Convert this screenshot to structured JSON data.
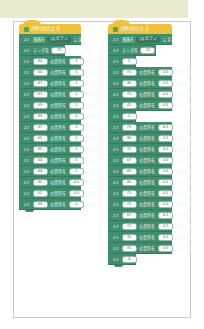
{
  "canvas": {
    "background_color": "#ffffff",
    "band_color": "#eaeace",
    "border_color": "#c8c8cc"
  },
  "palette": {
    "event_block": "#f0c23c",
    "music_block": "#3f8f6f",
    "music_block_dark": "#35795d",
    "oval_field": "#ffffff",
    "flag_green": "#55a84f"
  },
  "icons": {
    "green_flag": "green-flag-icon",
    "music_note": "♪♪"
  },
  "scripts": [
    {
      "id": "left",
      "hat": {
        "icon": "green-flag-icon",
        "label": "が押されたとき"
      },
      "blocks": [
        {
          "kind": "inst",
          "pre": "楽器を",
          "value": "(1) ピアノ",
          "post": "にする",
          "field": "drop"
        },
        {
          "kind": "tempo",
          "pre": "テンポを",
          "value": "72",
          "post": "にする",
          "field": "oval"
        },
        {
          "kind": "note",
          "pre": "",
          "value": "60",
          "mid": "の音符を",
          "beats": "1",
          "post": "拍鳴らす"
        },
        {
          "kind": "note",
          "pre": "",
          "value": "60",
          "mid": "の音符を",
          "beats": "1",
          "post": "拍鳴らす"
        },
        {
          "kind": "note",
          "pre": "",
          "value": "67",
          "mid": "の音符を",
          "beats": "1",
          "post": "拍鳴らす"
        },
        {
          "kind": "note",
          "pre": "",
          "value": "67",
          "mid": "の音符を",
          "beats": "1",
          "post": "拍鳴らす"
        },
        {
          "kind": "note",
          "pre": "",
          "value": "69",
          "mid": "の音符を",
          "beats": "1",
          "post": "拍鳴らす"
        },
        {
          "kind": "note",
          "pre": "",
          "value": "69",
          "mid": "の音符を",
          "beats": "2",
          "post": "拍鳴らす"
        },
        {
          "kind": "note",
          "pre": "",
          "value": "67",
          "mid": "の音符を",
          "beats": "2",
          "post": "拍鳴らす"
        },
        {
          "kind": "note",
          "pre": "",
          "value": "65",
          "mid": "の音符を",
          "beats": "1",
          "post": "拍鳴らす"
        },
        {
          "kind": "note",
          "pre": "",
          "value": "65",
          "mid": "の音符を",
          "beats": "1",
          "post": "拍鳴らす"
        },
        {
          "kind": "note",
          "pre": "",
          "value": "64",
          "mid": "の音符を",
          "beats": "1",
          "post": "拍鳴らす"
        },
        {
          "kind": "note",
          "pre": "",
          "value": "64",
          "mid": "の音符を",
          "beats": "1",
          "post": "拍鳴らす"
        },
        {
          "kind": "note",
          "pre": "",
          "value": "62",
          "mid": "の音符を",
          "beats": "0.5",
          "post": "拍鳴らす"
        },
        {
          "kind": "note",
          "pre": "",
          "value": "62",
          "mid": "の音符を",
          "beats": "0.5",
          "post": "拍鳴らす"
        },
        {
          "kind": "note",
          "pre": "",
          "value": "60",
          "mid": "の音符を",
          "beats": "2",
          "post": "拍鳴らす"
        }
      ]
    },
    {
      "id": "right",
      "hat": {
        "icon": "green-flag-icon",
        "label": "が押されたとき"
      },
      "blocks": [
        {
          "kind": "inst",
          "pre": "楽器を",
          "value": "(1) ピアノ",
          "post": "にする",
          "field": "drop"
        },
        {
          "kind": "tempo",
          "pre": "テンポを",
          "value": "72",
          "post": "にする",
          "field": "oval"
        },
        {
          "kind": "rest",
          "pre": "",
          "value": "2",
          "post": "拍休む"
        },
        {
          "kind": "note",
          "pre": "",
          "value": "71",
          "mid": "の音符を",
          "beats": "0.5",
          "post": "拍鳴らす"
        },
        {
          "kind": "note",
          "pre": "",
          "value": "36",
          "mid": "の音符を",
          "beats": "0.5",
          "post": "拍鳴らす"
        },
        {
          "kind": "note",
          "pre": "",
          "value": "72",
          "mid": "の音符を",
          "beats": "0.5",
          "post": "拍鳴らす"
        },
        {
          "kind": "note",
          "pre": "",
          "value": "41",
          "mid": "の音符を",
          "beats": "0.5",
          "post": "拍鳴らす"
        },
        {
          "kind": "rest",
          "pre": "",
          "value": "2",
          "post": "拍休む"
        },
        {
          "kind": "note",
          "pre": "",
          "value": "71",
          "mid": "の音符を",
          "beats": "0.5",
          "post": "拍鳴らす"
        },
        {
          "kind": "note",
          "pre": "",
          "value": "36",
          "mid": "の音符を",
          "beats": "0.5",
          "post": "拍鳴らす"
        },
        {
          "kind": "note",
          "pre": "",
          "value": "72",
          "mid": "の音符を",
          "beats": "0.5",
          "post": "拍鳴らす"
        },
        {
          "kind": "note",
          "pre": "",
          "value": "67",
          "mid": "の音符を",
          "beats": "0.5",
          "post": "拍鳴らす"
        },
        {
          "kind": "note",
          "pre": "",
          "value": "69",
          "mid": "の音符を",
          "beats": "0.5",
          "post": "拍鳴らす"
        },
        {
          "kind": "note",
          "pre": "",
          "value": "40",
          "mid": "の音符を",
          "beats": "0.5",
          "post": "拍鳴らす"
        },
        {
          "kind": "note",
          "pre": "",
          "value": "71",
          "mid": "の音符を",
          "beats": "0.5",
          "post": "拍鳴らす"
        },
        {
          "kind": "note",
          "pre": "",
          "value": "71",
          "mid": "の音符を",
          "beats": "0.5",
          "post": "拍鳴らす"
        },
        {
          "kind": "note",
          "pre": "",
          "value": "67",
          "mid": "の音符を",
          "beats": "0.5",
          "post": "拍鳴らす"
        },
        {
          "kind": "note",
          "pre": "",
          "value": "72",
          "mid": "の音符を",
          "beats": "0.5",
          "post": "拍鳴らす"
        },
        {
          "kind": "note",
          "pre": "",
          "value": "70",
          "mid": "の音符を",
          "beats": "0.5",
          "post": "拍鳴らす"
        },
        {
          "kind": "note",
          "pre": "",
          "value": "70",
          "mid": "の音符を",
          "beats": "0.5",
          "post": "拍鳴らす"
        },
        {
          "kind": "rest",
          "pre": "",
          "value": "4",
          "post": "拍休む"
        }
      ]
    }
  ]
}
